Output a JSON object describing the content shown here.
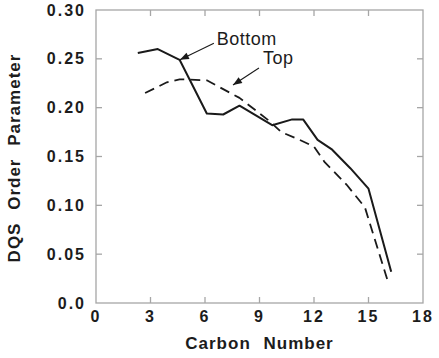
{
  "figure": {
    "background": "#ffffff",
    "frame_color": "#a6a6a6",
    "curve_color": "#1a1a1a",
    "text_color": "#1c1c1c"
  },
  "chart_data": {
    "type": "line",
    "title": "",
    "xlabel": "Carbon Number",
    "ylabel": "DQS Order Parameter",
    "xlim": [
      0,
      18
    ],
    "ylim": [
      0,
      0.3
    ],
    "grid": false,
    "legend": "inline annotation arrows",
    "x_ticks": [
      0,
      3,
      6,
      9,
      12,
      15,
      18
    ],
    "x_tick_labels": [
      "0",
      "3",
      "6",
      "9",
      "12",
      "15",
      "18"
    ],
    "y_ticks": [
      0,
      0.05,
      0.1,
      0.15,
      0.2,
      0.25,
      0.3
    ],
    "y_tick_labels": [
      "0.0",
      "0.05",
      "0.10",
      "0.15",
      "0.20",
      "0.25",
      "0.30"
    ],
    "series": [
      {
        "name": "Bottom",
        "style": "solid",
        "color": "#1a1a1a",
        "points": [
          [
            2.3,
            0.256
          ],
          [
            3.4,
            0.26
          ],
          [
            4.6,
            0.249
          ],
          [
            6.1,
            0.194
          ],
          [
            7.0,
            0.193
          ],
          [
            7.9,
            0.202
          ],
          [
            9.7,
            0.182
          ],
          [
            10.8,
            0.188
          ],
          [
            11.4,
            0.188
          ],
          [
            12.2,
            0.167
          ],
          [
            13.0,
            0.157
          ],
          [
            14.0,
            0.138
          ],
          [
            15.0,
            0.117
          ],
          [
            16.25,
            0.032
          ]
        ]
      },
      {
        "name": "Top",
        "style": "dashed",
        "color": "#1a1a1a",
        "points": [
          [
            2.7,
            0.215
          ],
          [
            3.9,
            0.226
          ],
          [
            4.6,
            0.229
          ],
          [
            6.1,
            0.228
          ],
          [
            7.4,
            0.215
          ],
          [
            7.9,
            0.21
          ],
          [
            9.5,
            0.187
          ],
          [
            10.2,
            0.175
          ],
          [
            11.1,
            0.168
          ],
          [
            12.0,
            0.16
          ],
          [
            12.6,
            0.144
          ],
          [
            13.8,
            0.121
          ],
          [
            14.8,
            0.098
          ],
          [
            16.1,
            0.02
          ]
        ]
      }
    ],
    "annotations": [
      {
        "label": "Bottom",
        "text_x": 6.65,
        "text_y": 0.264,
        "arrow_from": [
          6.49,
          0.266
        ],
        "arrow_to": [
          4.62,
          0.249
        ]
      },
      {
        "label": "Top",
        "text_x": 9.19,
        "text_y": 0.2447,
        "arrow_from": [
          8.97,
          0.2406
        ],
        "arrow_to": [
          7.54,
          0.2232
        ]
      }
    ]
  }
}
